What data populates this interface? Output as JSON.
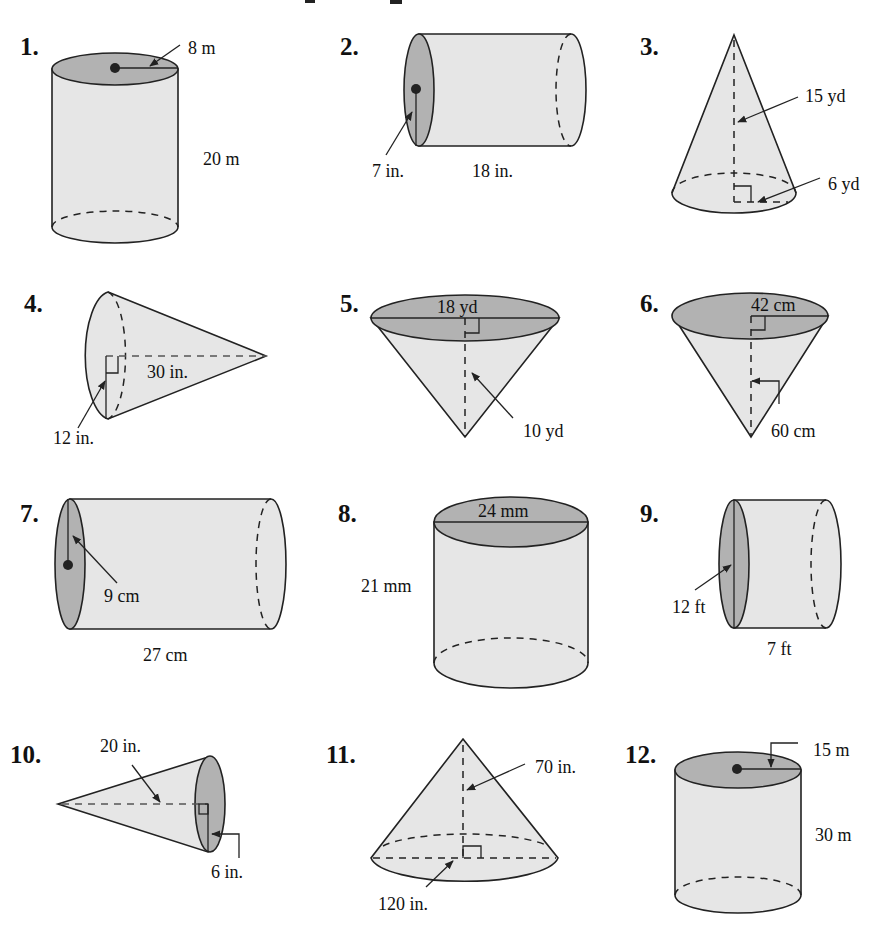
{
  "figures": [
    {
      "number": "1.",
      "shape": "cylinder",
      "orientation": "vertical",
      "labels": {
        "radius": "8 m",
        "height": "20 m"
      }
    },
    {
      "number": "2.",
      "shape": "cylinder",
      "orientation": "horizontal",
      "labels": {
        "radius": "7 in.",
        "length": "18 in."
      }
    },
    {
      "number": "3.",
      "shape": "cone",
      "orientation": "apex-up",
      "labels": {
        "height": "15 yd",
        "radius": "6 yd"
      }
    },
    {
      "number": "4.",
      "shape": "cone",
      "orientation": "apex-right",
      "labels": {
        "height": "30 in.",
        "radius": "12 in."
      }
    },
    {
      "number": "5.",
      "shape": "cone",
      "orientation": "apex-down",
      "labels": {
        "diameter": "18 yd",
        "height": "10 yd"
      }
    },
    {
      "number": "6.",
      "shape": "cone",
      "orientation": "apex-down",
      "labels": {
        "radius": "42 cm",
        "height": "60 cm"
      }
    },
    {
      "number": "7.",
      "shape": "cylinder",
      "orientation": "horizontal",
      "labels": {
        "radius": "9 cm",
        "length": "27 cm"
      }
    },
    {
      "number": "8.",
      "shape": "cylinder",
      "orientation": "vertical",
      "labels": {
        "diameter": "24 mm",
        "height": "21 mm"
      }
    },
    {
      "number": "9.",
      "shape": "cylinder",
      "orientation": "horizontal",
      "labels": {
        "diameter": "12 ft",
        "length": "7 ft"
      }
    },
    {
      "number": "10.",
      "shape": "cone",
      "orientation": "apex-left",
      "labels": {
        "height": "20 in.",
        "radius": "6 in."
      }
    },
    {
      "number": "11.",
      "shape": "cone",
      "orientation": "apex-up",
      "labels": {
        "height": "70 in.",
        "diameter": "120 in."
      }
    },
    {
      "number": "12.",
      "shape": "cylinder",
      "orientation": "vertical",
      "labels": {
        "radius": "15 m",
        "height": "30 m"
      }
    }
  ],
  "colors": {
    "body_fill": "#e6e6e6",
    "cap_fill": "#b2b2b2",
    "stroke": "#222222"
  }
}
